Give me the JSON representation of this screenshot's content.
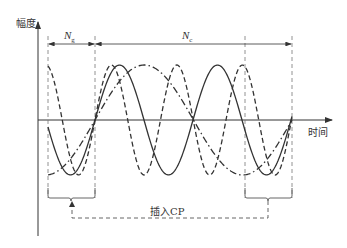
{
  "diagram": {
    "y_axis_label": "幅度",
    "x_axis_label": "时间",
    "guard_label": "N",
    "guard_sub": "g",
    "symbol_label": "N",
    "symbol_sub": "c",
    "cp_label": "插入CP",
    "colors": {
      "line": "#333333",
      "guide": "#777777"
    },
    "curves": [
      {
        "name": "subcarrier-1",
        "style": "solid",
        "period_px": 98
      },
      {
        "name": "subcarrier-2",
        "style": "dashed",
        "period_px": 65.5
      },
      {
        "name": "subcarrier-3",
        "style": "dash-dot",
        "period_px": 197
      }
    ]
  }
}
